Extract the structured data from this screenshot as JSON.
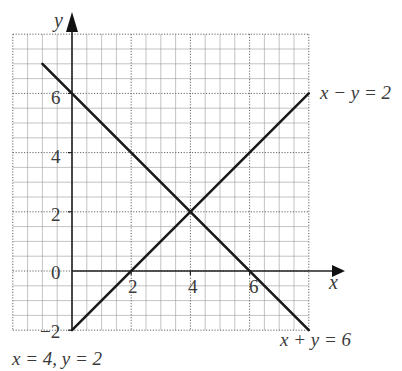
{
  "chart_data": {
    "type": "line",
    "title": "",
    "xlabel": "x",
    "ylabel": "y",
    "xlim": [
      -2,
      8
    ],
    "ylim": [
      -2,
      8
    ],
    "grid": true,
    "grid_minor_step": 0.5,
    "grid_major_step": 2,
    "x_ticks": [
      "2",
      "4",
      "6"
    ],
    "y_ticks": [
      "-2",
      "0",
      "2",
      "4",
      "6"
    ],
    "series": [
      {
        "name": "x + y = 6",
        "points": [
          [
            -1,
            7
          ],
          [
            8,
            -2
          ]
        ],
        "color": "#1a1a1a"
      },
      {
        "name": "x − y = 2",
        "points": [
          [
            0,
            -2
          ],
          [
            8,
            6
          ]
        ],
        "color": "#1a1a1a"
      }
    ],
    "annotations": {
      "line1_label": "x − y = 2",
      "line2_label": "x + y = 6",
      "solution": "x = 4, y = 2"
    },
    "intersection": [
      4,
      2
    ]
  },
  "labels": {
    "y_axis": "y",
    "x_axis": "x",
    "tick_y_6": "6",
    "tick_y_4": "4",
    "tick_y_2": "2",
    "tick_y_0": "0",
    "tick_y_m2": "−2",
    "tick_x_2": "2",
    "tick_x_4": "4",
    "tick_x_6": "6",
    "eq1": "x − y = 2",
    "eq2": "x + y = 6",
    "solution": "x = 4, y = 2"
  }
}
